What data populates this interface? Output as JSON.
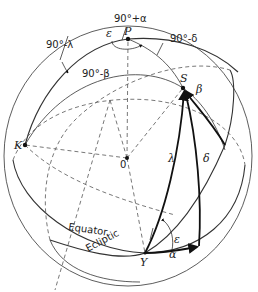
{
  "figure": {
    "points": {
      "north_pole": "P",
      "ecliptic_pole": "K",
      "star": "S",
      "center": "0",
      "vernal_equinox": "Υ"
    },
    "circles": {
      "equator": "Equator",
      "ecliptic": "Ecliptic"
    },
    "angles": {
      "obliquity_top": "ε",
      "obliquity_bottom": "ε",
      "ninety_plus_alpha": "90°+α",
      "ninety_minus_lambda": "90°-λ",
      "ninety_minus_beta": "90°-β",
      "ninety_minus_delta": "90°-δ",
      "right_ascension": "α",
      "declination": "δ",
      "ecliptic_longitude": "λ",
      "ecliptic_latitude": "β"
    },
    "colors": {
      "line": "#222222",
      "background": "#ffffff"
    }
  }
}
